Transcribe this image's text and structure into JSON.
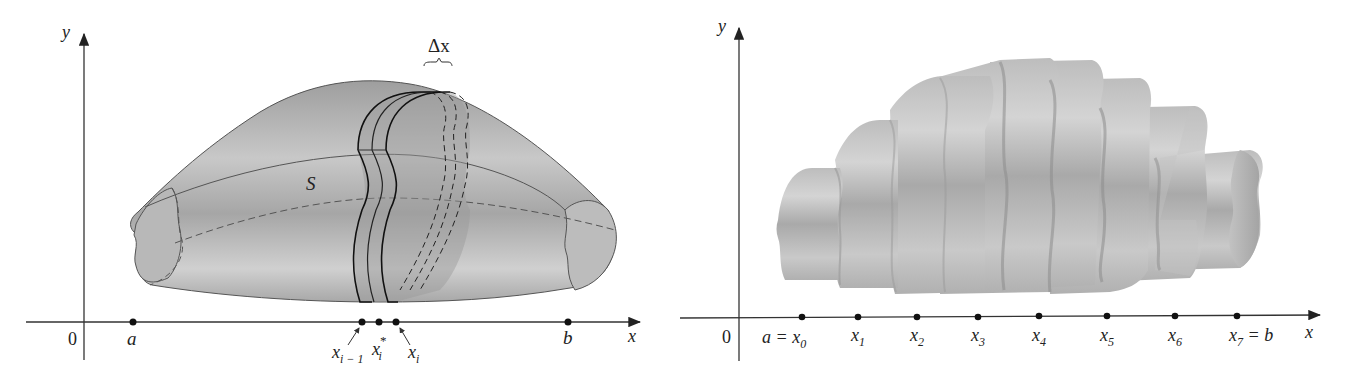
{
  "left_figure": {
    "y_axis_label": "y",
    "x_axis_label": "x",
    "origin_label": "0",
    "surface_label": "S",
    "delta_label": "Δx",
    "points": [
      {
        "label": "a",
        "sub": "",
        "sup": ""
      },
      {
        "label": "x",
        "sub": "i − 1",
        "sup": ""
      },
      {
        "label": "x",
        "sub": "i",
        "sup": "*"
      },
      {
        "label": "x",
        "sub": "i",
        "sup": ""
      },
      {
        "label": "b",
        "sub": "",
        "sup": ""
      }
    ]
  },
  "right_figure": {
    "y_axis_label": "y",
    "x_axis_label": "x",
    "origin_label": "0",
    "points": [
      {
        "pre": "a = ",
        "label": "x",
        "sub": "0",
        "post": ""
      },
      {
        "pre": "",
        "label": "x",
        "sub": "1",
        "post": ""
      },
      {
        "pre": "",
        "label": "x",
        "sub": "2",
        "post": ""
      },
      {
        "pre": "",
        "label": "x",
        "sub": "3",
        "post": ""
      },
      {
        "pre": "",
        "label": "x",
        "sub": "4",
        "post": ""
      },
      {
        "pre": "",
        "label": "x",
        "sub": "5",
        "post": ""
      },
      {
        "pre": "",
        "label": "x",
        "sub": "6",
        "post": ""
      },
      {
        "pre": "",
        "label": "x",
        "sub": "7",
        "post": " = b"
      }
    ]
  },
  "colors": {
    "surface": "#b4b4b4",
    "surface_light": "#d2d2d2",
    "surface_dark": "#8e8e8e",
    "axis": "#333333"
  }
}
